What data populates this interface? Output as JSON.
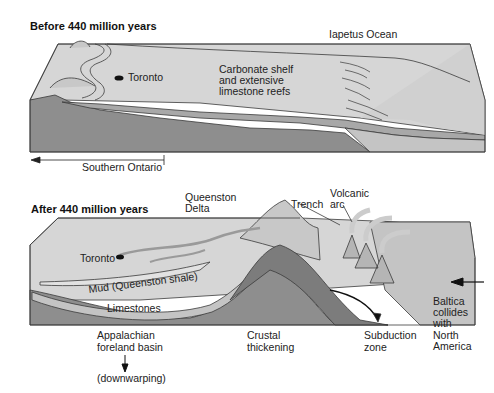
{
  "panels": [
    {
      "title": "Before 440 million years",
      "labels": {
        "ocean": "Iapetus Ocean",
        "city": "Toronto",
        "shelf_line1": "Carbonate shelf",
        "shelf_line2": "and extensive",
        "shelf_line3": "limestone reefs",
        "region": "Southern Ontario"
      }
    },
    {
      "title": "After 440 million years",
      "labels": {
        "delta_line1": "Queenston",
        "delta_line2": "Delta",
        "trench": "Trench",
        "volcanic_line1": "Volcanic",
        "volcanic_line2": "arc",
        "city": "Toronto",
        "mud": "Mud (Queenston shale)",
        "limestones": "Limestones",
        "basin_line1": "Appalachian",
        "basin_line2": "foreland basin",
        "downwarping": "(downwarping)",
        "crustal_line1": "Crustal",
        "crustal_line2": "thickening",
        "subduction_line1": "Subduction",
        "subduction_line2": "zone",
        "baltica_line1": "Baltica",
        "baltica_line2": "collides",
        "baltica_line3": "with",
        "baltica_line4": "North",
        "baltica_line5": "America"
      }
    }
  ],
  "colors": {
    "surface": "#d6d6d6",
    "side_light": "#c4c4c4",
    "layer_mid": "#a8a8a8",
    "basement": "#8e8e8e",
    "outline": "#3a3a3a"
  }
}
